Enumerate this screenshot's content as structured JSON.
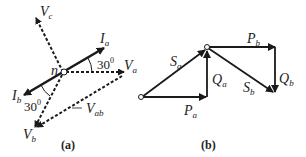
{
  "panel_a": {
    "caption": "(a)",
    "node_label": "n",
    "vectors": {
      "Vc": {
        "main": "V",
        "sub": "c",
        "style": "dashed"
      },
      "Ia": {
        "main": "I",
        "sub": "a",
        "style": "solid"
      },
      "Va": {
        "main": "V",
        "sub": "a",
        "style": "dashed"
      },
      "Ib": {
        "main": "I",
        "sub": "b",
        "style": "solid"
      },
      "Vb": {
        "main": "V",
        "sub": "b",
        "style": "dashed"
      },
      "Vab": {
        "main": "V",
        "sub": "ab",
        "style": "dashed"
      }
    },
    "angles": [
      {
        "value": "30",
        "unit": "0",
        "between": "Ia-Va"
      },
      {
        "value": "30",
        "unit": "0",
        "between": "Ib-Vb"
      }
    ]
  },
  "panel_b": {
    "caption": "(b)",
    "vectors": {
      "Sa": {
        "main": "S",
        "sub": "a"
      },
      "Pa": {
        "main": "P",
        "sub": "a"
      },
      "Qa": {
        "main": "Q",
        "sub": "a"
      },
      "Pb": {
        "main": "P",
        "sub": "b"
      },
      "Qb": {
        "main": "Q",
        "sub": "b"
      },
      "Sb": {
        "main": "S",
        "sub": "b"
      }
    }
  },
  "colors": {
    "stroke": "#1a1a1a",
    "background": "#ffffff"
  }
}
